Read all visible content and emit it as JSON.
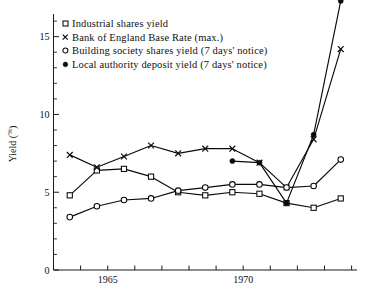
{
  "chart_data": {
    "type": "line",
    "title": "",
    "xlabel": "",
    "ylabel": "Yield (%)",
    "ylabel_main": "Yield (",
    "ylabel_unit": "%",
    "ylabel_close": ")",
    "xlim": [
      1963,
      1974.2
    ],
    "ylim": [
      0,
      16.2
    ],
    "grid": false,
    "legend_position": "top-left-inside",
    "y_ticks_major": [
      0,
      5,
      10,
      15
    ],
    "y_tick_labels": [
      "0",
      "5",
      "10",
      "15"
    ],
    "y_ticks_minor": [
      1,
      2,
      3,
      4,
      6,
      7,
      8,
      9,
      11,
      12,
      13,
      14,
      16
    ],
    "x_ticks": [
      1963,
      1964,
      1965,
      1966,
      1967,
      1968,
      1969,
      1970,
      1971,
      1972,
      1973,
      1974
    ],
    "x_tick_labels_shown": [
      "1965",
      "1970"
    ],
    "x_labeled_values": [
      1965,
      1970
    ],
    "series": [
      {
        "name": "Industrial shares yield",
        "marker": "open-square",
        "x": [
          1963.6,
          1964.6,
          1965.6,
          1966.6,
          1967.6,
          1968.6,
          1969.6,
          1970.6,
          1971.6,
          1972.6,
          1973.6
        ],
        "values": [
          4.8,
          6.4,
          6.5,
          6.0,
          5.0,
          4.8,
          5.0,
          4.9,
          4.3,
          4.0,
          4.6
        ]
      },
      {
        "name": "Bank of England Base Rate (max.)",
        "marker": "cross",
        "x": [
          1963.6,
          1964.6,
          1965.6,
          1966.6,
          1967.6,
          1968.6,
          1969.6,
          1970.6,
          1971.6,
          1972.6,
          1973.6
        ],
        "values": [
          7.4,
          6.6,
          7.3,
          8.0,
          7.5,
          7.8,
          7.8,
          6.9,
          5.3,
          8.4,
          14.2
        ]
      },
      {
        "name": "Building society shares yield  (7 days' notice)",
        "marker": "open-circle",
        "x": [
          1963.6,
          1964.6,
          1965.6,
          1966.6,
          1967.6,
          1968.6,
          1969.6,
          1970.6,
          1971.6,
          1972.6,
          1973.6
        ],
        "values": [
          3.4,
          4.1,
          4.5,
          4.6,
          5.1,
          5.3,
          5.5,
          5.5,
          5.3,
          5.4,
          7.1
        ]
      },
      {
        "name": "Local authority deposit yield (7 days' notice)",
        "marker": "filled-circle",
        "x": [
          1969.6,
          1970.6,
          1971.6,
          1972.6,
          1973.6
        ],
        "values": [
          7.0,
          6.9,
          4.3,
          8.7,
          17.3
        ]
      }
    ]
  },
  "legend": {
    "items": [
      {
        "label": "Industrial shares yield",
        "marker": "open-square"
      },
      {
        "label": "Bank of England Base Rate (max.)",
        "marker": "cross"
      },
      {
        "label": "Building society shares yield  (7 days' notice)",
        "marker": "open-circle"
      },
      {
        "label": "Local authority deposit yield (7 days' notice)",
        "marker": "filled-circle"
      }
    ]
  },
  "colors": {
    "ink": "#0a0a0a",
    "background": "#ffffff"
  }
}
